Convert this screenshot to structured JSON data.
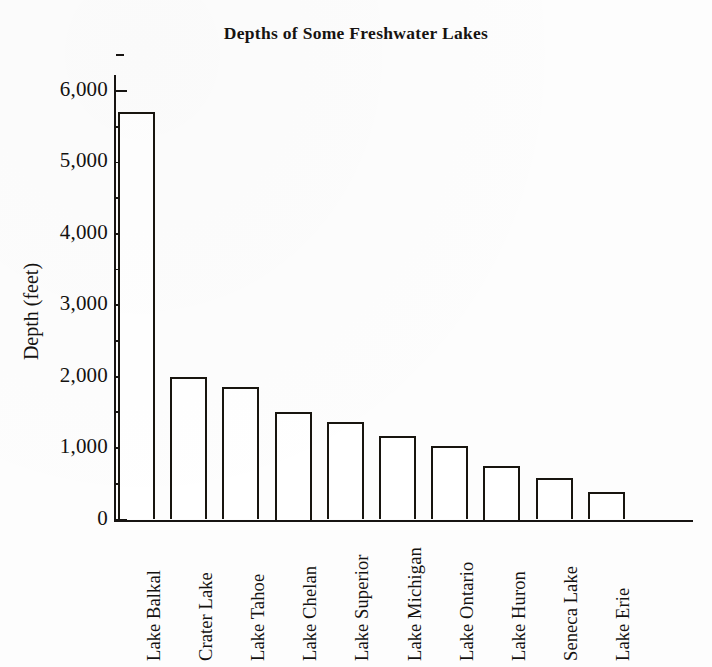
{
  "chart_data": {
    "type": "bar",
    "title": "Depths of Some Freshwater Lakes",
    "xlabel": "",
    "ylabel": "Depth (feet)",
    "categories": [
      "Lake Balkal",
      "Crater Lake",
      "Lake Tahoe",
      "Lake Chelan",
      "Lake Superior",
      "Lake Michigan",
      "Lake Ontario",
      "Lake Huron",
      "Seneca Lake",
      "Lake Erie"
    ],
    "values": [
      5700,
      2000,
      1850,
      1500,
      1360,
      1170,
      1030,
      750,
      580,
      380
    ],
    "ylim": [
      0,
      6000
    ],
    "ytick_values": [
      0,
      1000,
      2000,
      3000,
      4000,
      5000,
      6000
    ],
    "ytick_labels": [
      "0",
      "1,000",
      "2,000",
      "3,000",
      "4,000",
      "5,000",
      "6,000"
    ],
    "yminor_tick_values": [
      500,
      1500,
      2500,
      3500,
      4500,
      5500,
      6500
    ],
    "grid": false,
    "legend": false,
    "bar_fill_color": "#ffffff",
    "bar_edge_color": "#18150f",
    "background_color": "#fdfdfd"
  }
}
